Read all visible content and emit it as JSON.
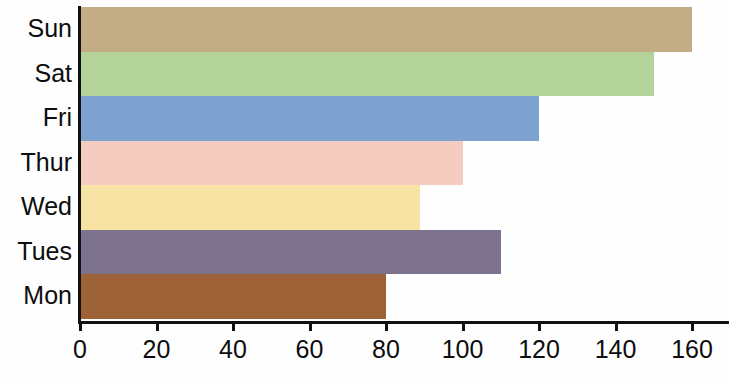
{
  "chart_data": {
    "type": "bar",
    "orientation": "horizontal",
    "title": "",
    "xlabel": "",
    "ylabel": "",
    "categories": [
      "Mon",
      "Tues",
      "Wed",
      "Thur",
      "Fri",
      "Sat",
      "Sun"
    ],
    "values": [
      80,
      110,
      89,
      100,
      120,
      150,
      160
    ],
    "colors": [
      "#9e6239",
      "#7d738f",
      "#f7e3a3",
      "#f6ccc0",
      "#7da2d0",
      "#b3d39a",
      "#c3ad87"
    ],
    "xlim": [
      0,
      168
    ],
    "ylim": [
      0,
      7
    ],
    "xticks": [
      0,
      20,
      40,
      60,
      80,
      100,
      120,
      140,
      160
    ],
    "xtick_labels": [
      "0",
      "20",
      "40",
      "60",
      "80",
      "100",
      "120",
      "140",
      "160"
    ],
    "ytick_labels": [
      "Sun",
      "Sat",
      "Fri",
      "Thur",
      "Wed",
      "Tues",
      "Mon"
    ],
    "grid": false,
    "legend": false,
    "bar_order_top_to_bottom": [
      "Sun",
      "Sat",
      "Fri",
      "Thur",
      "Wed",
      "Tues",
      "Mon"
    ],
    "series": [
      {
        "name": "value",
        "points": [
          {
            "category": "Sun",
            "value": 160,
            "color": "#c3ad87"
          },
          {
            "category": "Sat",
            "value": 150,
            "color": "#b3d39a"
          },
          {
            "category": "Fri",
            "value": 120,
            "color": "#7da2d0"
          },
          {
            "category": "Thur",
            "value": 100,
            "color": "#f6ccc0"
          },
          {
            "category": "Wed",
            "value": 89,
            "color": "#f7e3a3"
          },
          {
            "category": "Tues",
            "value": 110,
            "color": "#7d738f"
          },
          {
            "category": "Mon",
            "value": 80,
            "color": "#9e6239"
          }
        ]
      }
    ]
  },
  "axes": {
    "x_origin_value": 0,
    "x_max_value": 168,
    "axis_color": "#111111"
  }
}
